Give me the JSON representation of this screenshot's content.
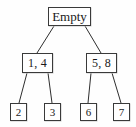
{
  "diagram": {
    "type": "binary-tree",
    "nodes": [
      {
        "id": "root",
        "label": "Empty",
        "level": 0
      },
      {
        "id": "n-l",
        "label": "1, 4",
        "level": 1
      },
      {
        "id": "n-r",
        "label": "5, 8",
        "level": 1
      },
      {
        "id": "leaf-1",
        "label": "2",
        "level": 2
      },
      {
        "id": "leaf-2",
        "label": "3",
        "level": 2
      },
      {
        "id": "leaf-3",
        "label": "6",
        "level": 2
      },
      {
        "id": "leaf-4",
        "label": "7",
        "level": 2
      }
    ],
    "edges": [
      {
        "from": "root",
        "to": "n-l"
      },
      {
        "from": "root",
        "to": "n-r"
      },
      {
        "from": "n-l",
        "to": "leaf-1"
      },
      {
        "from": "n-l",
        "to": "leaf-2"
      },
      {
        "from": "n-r",
        "to": "leaf-3"
      },
      {
        "from": "n-r",
        "to": "leaf-4"
      }
    ],
    "colors": {
      "background": "#fefefe",
      "box_border": "#3a3a3a",
      "box_fill": "#ffffff",
      "edge": "#2e2e2e",
      "text": "#1a1a1a"
    }
  }
}
